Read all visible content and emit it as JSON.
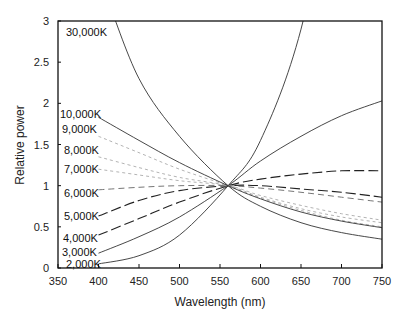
{
  "chart_data": {
    "type": "line",
    "title": "",
    "xlabel": "Wavelength (nm)",
    "ylabel": "Relative power",
    "xlim": [
      350,
      750
    ],
    "ylim": [
      0,
      3
    ],
    "xticks": [
      350,
      400,
      450,
      500,
      550,
      600,
      650,
      700,
      750
    ],
    "yticks": [
      0,
      0.5,
      1,
      1.5,
      2,
      2.5,
      3
    ],
    "ytick_labels": [
      "0",
      "0.5",
      "1",
      "1.5",
      "2",
      "2.5",
      "3"
    ],
    "grid": false,
    "legend": "inline labels at left edge",
    "x": [
      400,
      450,
      500,
      560,
      600,
      650,
      700,
      750
    ],
    "series": [
      {
        "name": "2,000K",
        "style": "solid",
        "values": [
          0.05,
          0.15,
          0.4,
          1.0,
          1.55,
          2.9,
          null,
          null
        ]
      },
      {
        "name": "3,000K",
        "style": "solid",
        "values": [
          0.18,
          0.38,
          0.62,
          1.0,
          1.3,
          1.6,
          1.85,
          2.03
        ]
      },
      {
        "name": "4,000K",
        "style": "dashed",
        "values": [
          0.4,
          0.6,
          0.8,
          1.0,
          1.08,
          1.14,
          1.18,
          1.18
        ]
      },
      {
        "name": "5,000K",
        "style": "dashed",
        "values": [
          0.63,
          0.82,
          0.94,
          1.0,
          1.0,
          0.96,
          0.92,
          0.86
        ]
      },
      {
        "name": "6,000K",
        "style": "dashed-light",
        "values": [
          0.95,
          0.98,
          1.0,
          1.0,
          0.97,
          0.92,
          0.86,
          0.8
        ]
      },
      {
        "name": "7,000K",
        "style": "dotted-light",
        "values": [
          1.2,
          1.13,
          1.06,
          1.0,
          0.88,
          0.76,
          0.66,
          0.58
        ]
      },
      {
        "name": "8,000K",
        "style": "dotted-light",
        "values": [
          1.35,
          1.22,
          1.1,
          1.0,
          0.86,
          0.72,
          0.62,
          0.55
        ]
      },
      {
        "name": "9,000K",
        "style": "dotted-light",
        "values": [
          1.6,
          1.4,
          1.2,
          1.0,
          0.85,
          0.7,
          0.58,
          0.5
        ]
      },
      {
        "name": "10,000K",
        "style": "solid",
        "values": [
          1.83,
          1.55,
          1.28,
          1.0,
          0.84,
          0.68,
          0.57,
          0.49
        ]
      },
      {
        "name": "30,000K",
        "style": "solid",
        "values": [
          null,
          2.3,
          1.6,
          1.0,
          0.75,
          0.55,
          0.43,
          0.35
        ]
      }
    ],
    "series_label_positions": [
      {
        "name": "2,000K",
        "x": 66,
        "y": 268
      },
      {
        "name": "3,000K",
        "x": 62,
        "y": 256
      },
      {
        "name": "4,000K",
        "x": 63,
        "y": 242
      },
      {
        "name": "5,000K",
        "x": 64,
        "y": 220
      },
      {
        "name": "6,000K",
        "x": 64,
        "y": 197
      },
      {
        "name": "7,000K",
        "x": 64,
        "y": 173
      },
      {
        "name": "8,000K",
        "x": 64,
        "y": 154
      },
      {
        "name": "9,000K",
        "x": 62,
        "y": 133
      },
      {
        "name": "10,000K",
        "x": 60,
        "y": 118
      },
      {
        "name": "30,000K",
        "x": 66,
        "y": 36
      }
    ]
  }
}
